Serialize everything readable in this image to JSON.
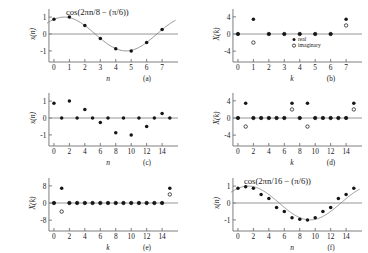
{
  "figure": {
    "background": "#ffffff",
    "ink": "#161616",
    "axis_color": "#6f6f6f",
    "curve_color": "#7d7d7d"
  },
  "chart_data": [
    {
      "id": "a",
      "type": "scatter",
      "caption": "(a)",
      "annotation": "cos(2πn/8 − (π/6))",
      "xlabel": "n",
      "ylabel": "x(n)",
      "xlim": [
        -0.45,
        7.9
      ],
      "ylim": [
        -1.42,
        1.42
      ],
      "xticks": [
        0,
        1,
        2,
        3,
        4,
        5,
        6,
        7
      ],
      "xticklabels": [
        "0",
        "1",
        "2",
        "3",
        "4",
        "5",
        "6",
        "7"
      ],
      "yticks": [
        1,
        0,
        -1
      ],
      "yticklabels": [
        "1",
        "0",
        "-1"
      ],
      "grid": false,
      "has_continuous_curve": true,
      "series": [
        {
          "name": "x(n)",
          "marker": "filled",
          "x": [
            0,
            1,
            2,
            3,
            4,
            5,
            6,
            7
          ],
          "values": [
            0.866,
            1.0,
            0.5,
            -0.259,
            -0.866,
            -1.0,
            -0.5,
            0.259
          ]
        }
      ]
    },
    {
      "id": "b",
      "type": "scatter",
      "caption": "(b)",
      "annotation": "",
      "xlabel": "k",
      "ylabel": "X(k)",
      "xlim": [
        -0.45,
        7.9
      ],
      "ylim": [
        -5.6,
        5.6
      ],
      "xticks": [
        0,
        1,
        2,
        3,
        4,
        5,
        6,
        7
      ],
      "xticklabels": [
        "0",
        "1",
        "2",
        "3",
        "4",
        "5",
        "6",
        "7"
      ],
      "yticks": [
        4,
        0,
        -4
      ],
      "yticklabels": [
        "4",
        "0",
        "-4"
      ],
      "grid": false,
      "has_continuous_curve": false,
      "legend": {
        "position": "inside-lower-right",
        "entries": [
          {
            "label": "real",
            "marker": "filled"
          },
          {
            "label": "imaginary",
            "marker": "open"
          }
        ]
      },
      "series": [
        {
          "name": "real",
          "marker": "filled",
          "x": [
            0,
            1,
            2,
            3,
            4,
            5,
            6,
            7
          ],
          "values": [
            0,
            3.46,
            0,
            0,
            0,
            0,
            0,
            3.46
          ]
        },
        {
          "name": "imaginary",
          "marker": "open",
          "x": [
            0,
            1,
            2,
            3,
            4,
            5,
            6,
            7
          ],
          "values": [
            0,
            -2.0,
            0,
            0,
            0,
            0,
            0,
            2.0
          ]
        }
      ]
    },
    {
      "id": "c",
      "type": "scatter",
      "caption": "(c)",
      "annotation": "",
      "xlabel": "n",
      "ylabel": "x(n)",
      "xlim": [
        -0.9,
        15.8
      ],
      "ylim": [
        -1.42,
        1.42
      ],
      "xticks": [
        0,
        2,
        4,
        6,
        8,
        10,
        12,
        14
      ],
      "xticklabels": [
        "0",
        "2",
        "4",
        "6",
        "8",
        "10",
        "12",
        "14"
      ],
      "yticks": [
        1,
        0,
        -1
      ],
      "yticklabels": [
        "1",
        "0",
        "-1"
      ],
      "grid": false,
      "has_continuous_curve": false,
      "series": [
        {
          "name": "x(n)",
          "marker": "filled",
          "x": [
            0,
            1,
            2,
            3,
            4,
            5,
            6,
            7,
            8,
            9,
            10,
            11,
            12,
            13,
            14,
            15
          ],
          "values": [
            0.866,
            0,
            1.0,
            0,
            0.5,
            0,
            -0.259,
            0,
            -0.866,
            0,
            -1.0,
            0,
            -0.5,
            0,
            0.259,
            0
          ]
        }
      ]
    },
    {
      "id": "d",
      "type": "scatter",
      "caption": "(d)",
      "annotation": "",
      "xlabel": "k",
      "ylabel": "X(k)",
      "xlim": [
        -0.9,
        15.8
      ],
      "ylim": [
        -5.6,
        5.6
      ],
      "xticks": [
        0,
        2,
        4,
        6,
        8,
        10,
        12,
        14
      ],
      "xticklabels": [
        "0",
        "2",
        "4",
        "6",
        "8",
        "10",
        "12",
        "14"
      ],
      "yticks": [
        4,
        0,
        -4
      ],
      "yticklabels": [
        "4",
        "0",
        "-4"
      ],
      "grid": false,
      "has_continuous_curve": false,
      "series": [
        {
          "name": "real",
          "marker": "filled",
          "x": [
            0,
            1,
            2,
            3,
            4,
            5,
            6,
            7,
            8,
            9,
            10,
            11,
            12,
            13,
            14,
            15
          ],
          "values": [
            0,
            3.46,
            0,
            0,
            0,
            0,
            0,
            3.46,
            0,
            3.46,
            0,
            0,
            0,
            0,
            0,
            3.46
          ]
        },
        {
          "name": "imaginary",
          "marker": "open",
          "x": [
            0,
            1,
            2,
            3,
            4,
            5,
            6,
            7,
            8,
            9,
            10,
            11,
            12,
            13,
            14,
            15
          ],
          "values": [
            0,
            -2.0,
            0,
            0,
            0,
            0,
            0,
            2.0,
            0,
            -2.0,
            0,
            0,
            0,
            0,
            0,
            2.0
          ]
        }
      ]
    },
    {
      "id": "e",
      "type": "scatter",
      "caption": "(e)",
      "annotation": "",
      "xlabel": "k",
      "ylabel": "X(k)",
      "xlim": [
        -0.9,
        15.8
      ],
      "ylim": [
        -11.2,
        11.2
      ],
      "xticks": [
        0,
        2,
        4,
        6,
        8,
        10,
        12,
        14
      ],
      "xticklabels": [
        "0",
        "2",
        "4",
        "6",
        "8",
        "10",
        "12",
        "14"
      ],
      "yticks": [
        8,
        0,
        -8
      ],
      "yticklabels": [
        "8",
        "0",
        "-8"
      ],
      "grid": false,
      "has_continuous_curve": false,
      "series": [
        {
          "name": "real",
          "marker": "filled",
          "x": [
            0,
            1,
            2,
            3,
            4,
            5,
            6,
            7,
            8,
            9,
            10,
            11,
            12,
            13,
            14,
            15
          ],
          "values": [
            0,
            6.93,
            0,
            0,
            0,
            0,
            0,
            0,
            0,
            0,
            0,
            0,
            0,
            0,
            0,
            6.93
          ]
        },
        {
          "name": "imaginary",
          "marker": "open",
          "x": [
            0,
            1,
            2,
            3,
            4,
            5,
            6,
            7,
            8,
            9,
            10,
            11,
            12,
            13,
            14,
            15
          ],
          "values": [
            0,
            -4.0,
            0,
            0,
            0,
            0,
            0,
            0,
            0,
            0,
            0,
            0,
            0,
            0,
            0,
            4.0
          ]
        }
      ]
    },
    {
      "id": "f",
      "type": "scatter",
      "caption": "(f)",
      "annotation": "cos(2πn/16 − (π/6))",
      "xlabel": "n",
      "ylabel": "x(n)",
      "xlim": [
        -0.9,
        15.8
      ],
      "ylim": [
        -1.42,
        1.42
      ],
      "xticks": [
        0,
        2,
        4,
        6,
        8,
        10,
        12,
        14
      ],
      "xticklabels": [
        "0",
        "2",
        "4",
        "6",
        "8",
        "10",
        "12",
        "14"
      ],
      "yticks": [
        1,
        0,
        -1
      ],
      "yticklabels": [
        "1",
        "0",
        "-1"
      ],
      "grid": false,
      "has_continuous_curve": true,
      "series": [
        {
          "name": "x(n)",
          "marker": "filled",
          "x": [
            0,
            1,
            2,
            3,
            4,
            5,
            6,
            7,
            8,
            9,
            10,
            11,
            12,
            13,
            14,
            15
          ],
          "values": [
            0.866,
            0.966,
            0.866,
            0.5,
            0.259,
            -0.259,
            -0.5,
            -0.866,
            -0.966,
            -1.0,
            -0.866,
            -0.5,
            -0.259,
            0.259,
            0.5,
            0.866
          ]
        }
      ]
    }
  ]
}
